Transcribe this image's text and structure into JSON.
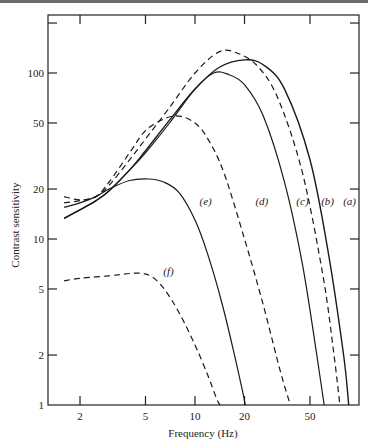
{
  "chart_data": {
    "type": "line",
    "title": "",
    "xlabel": "Frequency (Hz)",
    "ylabel": "Contrast sensitivity",
    "xscale": "log",
    "yscale": "log",
    "xlim": [
      1.5,
      95
    ],
    "ylim": [
      1,
      220
    ],
    "grid": false,
    "legend": "inline curve labels",
    "xticks": [
      {
        "value": 2,
        "label": "2"
      },
      {
        "value": 5,
        "label": "5"
      },
      {
        "value": 10,
        "label": "10"
      },
      {
        "value": 20,
        "label": "20"
      },
      {
        "value": 50,
        "label": "50"
      }
    ],
    "yticks": [
      {
        "value": 1,
        "label": "1"
      },
      {
        "value": 2,
        "label": "2"
      },
      {
        "value": 5,
        "label": "5"
      },
      {
        "value": 10,
        "label": "10"
      },
      {
        "value": 20,
        "label": "20"
      },
      {
        "value": 50,
        "label": "50"
      },
      {
        "value": 100,
        "label": "100"
      },
      {
        "value": 200,
        "label": ""
      }
    ],
    "series": [
      {
        "name": "(a)",
        "style": "solid",
        "weight": 1.4,
        "x": [
          1.6,
          2.0,
          2.5,
          3.0,
          4.0,
          5.0,
          7.0,
          10,
          14,
          20,
          26,
          35,
          50,
          65,
          80,
          86
        ],
        "y": [
          13.3,
          15.0,
          17.0,
          19.5,
          26,
          34,
          52,
          80,
          108,
          120,
          112,
          80,
          30,
          8,
          2,
          1
        ],
        "label_pos": [
          87,
          17
        ]
      },
      {
        "name": "(b)",
        "style": "dashed",
        "weight": 1.2,
        "x": [
          1.6,
          2.0,
          2.5,
          3.0,
          4.0,
          5.0,
          7.0,
          10,
          14,
          18,
          24,
          32,
          45,
          60,
          70,
          76
        ],
        "y": [
          16.5,
          17.0,
          18.0,
          21,
          30,
          40,
          62,
          100,
          134,
          132,
          110,
          70,
          25,
          6,
          2,
          1
        ],
        "label_pos": [
          64,
          17
        ]
      },
      {
        "name": "(c)",
        "style": "solid",
        "weight": 1.2,
        "x": [
          1.6,
          2.0,
          2.5,
          3.0,
          4.0,
          5.0,
          7.0,
          10,
          13,
          16,
          20,
          26,
          35,
          45,
          55,
          61
        ],
        "y": [
          13.3,
          15.0,
          17.0,
          19.5,
          26,
          33,
          50,
          80,
          100,
          98,
          85,
          55,
          22,
          7,
          2,
          1
        ],
        "label_pos": [
          45,
          17
        ]
      },
      {
        "name": "(d)",
        "style": "dashed",
        "weight": 1.2,
        "x": [
          1.6,
          2.0,
          2.5,
          3.0,
          4.0,
          5.0,
          6.5,
          8.0,
          10,
          12,
          15,
          20,
          26,
          33,
          38
        ],
        "y": [
          18.0,
          17.2,
          18.0,
          22,
          33,
          45,
          53,
          55,
          50,
          40,
          25,
          10,
          4,
          1.6,
          1
        ],
        "label_pos": [
          25.5,
          17
        ]
      },
      {
        "name": "(e)",
        "style": "solid",
        "weight": 1.2,
        "x": [
          1.6,
          2.0,
          2.5,
          3.0,
          4.0,
          5.2,
          6.5,
          8.0,
          10,
          12,
          14.5,
          17,
          19.5,
          20.2
        ],
        "y": [
          15.5,
          16.5,
          18.0,
          20,
          22.5,
          23,
          22,
          19,
          13,
          8,
          4.2,
          2.2,
          1.2,
          1
        ],
        "label_pos": [
          11.6,
          17
        ]
      },
      {
        "name": "(f)",
        "style": "dashed",
        "weight": 1.2,
        "x": [
          1.6,
          2.0,
          3.0,
          4.0,
          4.8,
          5.5,
          6.5,
          8.0,
          10,
          12,
          13.5,
          14.2
        ],
        "y": [
          5.6,
          5.8,
          6.0,
          6.2,
          6.2,
          5.9,
          5.0,
          3.6,
          2.3,
          1.5,
          1.1,
          1
        ],
        "label_pos": [
          6.9,
          6.4
        ]
      }
    ]
  }
}
